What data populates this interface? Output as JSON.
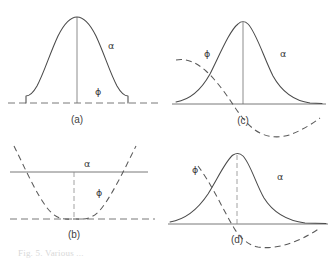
{
  "figure": {
    "background_color": "#ffffff",
    "stroke_color": "#4a4a4a",
    "caption_partial": "Fig. 5. Various  ...",
    "panels": [
      {
        "id": "a",
        "label": "(a)",
        "alpha_label": "α",
        "phi_label": "ϕ",
        "alpha_style": "solid",
        "phi_style": "dashed",
        "description": "symmetric bell curve alpha over flat dashed phi baseline"
      },
      {
        "id": "b",
        "label": "(b)",
        "alpha_label": "α",
        "phi_label": "ϕ",
        "alpha_style": "solid",
        "phi_style": "dashed",
        "description": "flat solid alpha line with dashed upward parabola phi"
      },
      {
        "id": "c",
        "label": "(c)",
        "alpha_label": "α",
        "phi_label": "ϕ",
        "alpha_style": "solid",
        "phi_style": "dashed",
        "description": "bell curve alpha with descending dashed phi crossing left flank"
      },
      {
        "id": "d",
        "label": "(d)",
        "alpha_label": "α",
        "phi_label": "ϕ",
        "alpha_style": "solid",
        "phi_style": "dashed",
        "description": "bell curve alpha with dashed phi descending below axis into a trough"
      }
    ]
  }
}
